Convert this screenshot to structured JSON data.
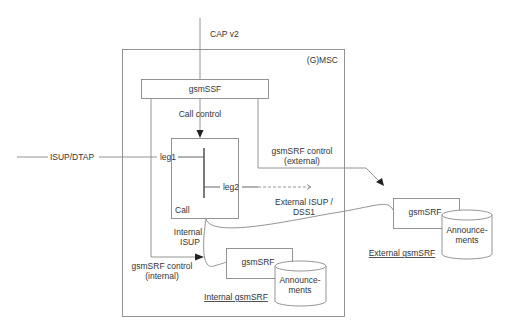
{
  "diagram": {
    "type": "architecture",
    "container": {
      "label": "(G)MSC"
    },
    "interfaces": {
      "cap": "CAP v2",
      "isup_dtap": "ISUP/DTAP",
      "external_isup_line1": "External ISUP /",
      "external_isup_line2": "DSS1",
      "internal_isup_line1": "Internal",
      "internal_isup_line2": "ISUP"
    },
    "nodes": {
      "gsmssf": {
        "label": "gsmSSF"
      },
      "call": {
        "label": "Call",
        "leg1": "leg1",
        "leg2": "leg2"
      },
      "internal_srf": {
        "label": "gsmSRF",
        "db_line1": "Announce-",
        "db_line2": "ments",
        "caption": "Internal gsmSRF"
      },
      "external_srf": {
        "label": "gsmSRF",
        "db_line1": "Announce-",
        "db_line2": "ments",
        "caption": "External gsmSRF"
      }
    },
    "edges": {
      "call_control": "Call control",
      "srf_control_external_line1": "gsmSRF control",
      "srf_control_external_line2": "(external)",
      "srf_control_internal_line1": "gsmSRF control",
      "srf_control_internal_line2": "(internal)"
    }
  }
}
